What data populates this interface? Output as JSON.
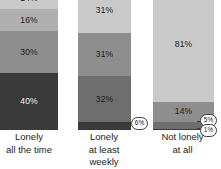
{
  "chart_data": {
    "type": "bar",
    "subtype": "100% stacked column",
    "title": "",
    "subtitle": "",
    "xlabel": "",
    "ylabel": "",
    "ylim": [
      0,
      100
    ],
    "grid": false,
    "legend": "none",
    "note": "Top of the columns is cropped out of frame; topmost segment of each column is partially visible.",
    "categories": [
      "Lonely\nall the time",
      "Lonely\nat least weekly",
      "Not lonely\nat all"
    ],
    "series": [
      {
        "name": "segment-1-lightest",
        "values": [
          14,
          31,
          81
        ]
      },
      {
        "name": "segment-2",
        "values": [
          16,
          31,
          14
        ]
      },
      {
        "name": "segment-3",
        "values": [
          30,
          31,
          5
        ]
      },
      {
        "name": "segment-4",
        "values": [
          40,
          32,
          1
        ]
      },
      {
        "name": "segment-5-darkest",
        "values": [
          null,
          6,
          null
        ]
      }
    ]
  },
  "colors": {
    "background": "#ffffff",
    "shade_lightest": "#c9c9c9",
    "shade_light": "#b0b0b0",
    "shade_mid": "#8e8e8e",
    "shade_dark": "#6e6e6e",
    "shade_darkest": "#3a3a3a",
    "callout_border": "#3a3a3a",
    "label_dark": "#1a1a1a",
    "label_light": "#f2f2f2"
  },
  "columns": [
    {
      "id": "lonely-all-the-time",
      "label_line1": "Lonely",
      "label_line2": "all the time",
      "segments": [
        {
          "value": "14%",
          "pct": 14,
          "shade": "shade_lightest",
          "label_on_dark": false,
          "label_visible": true
        },
        {
          "value": "16%",
          "pct": 16,
          "shade": "shade_light",
          "label_on_dark": false,
          "label_visible": true
        },
        {
          "value": "30%",
          "pct": 30,
          "shade": "shade_mid",
          "label_on_dark": false,
          "label_visible": true
        },
        {
          "value": "40%",
          "pct": 40,
          "shade": "shade_darkest",
          "label_on_dark": true,
          "label_visible": true
        }
      ],
      "callouts": []
    },
    {
      "id": "lonely-at-least-weekly",
      "label_line1": "Lonely",
      "label_line2": "at least weekly",
      "segments": [
        {
          "value": "31%",
          "pct": 31,
          "shade": "shade_lightest",
          "label_on_dark": false,
          "label_visible": true
        },
        {
          "value": "31%",
          "pct": 31,
          "shade": "shade_mid",
          "label_on_dark": false,
          "label_visible": true
        },
        {
          "value": "32%",
          "pct": 32,
          "shade": "shade_dark",
          "label_on_dark": false,
          "label_visible": true
        },
        {
          "value": "6%",
          "pct": 6,
          "shade": "shade_darkest",
          "label_on_dark": true,
          "label_visible": false
        }
      ],
      "callouts": [
        {
          "value": "6%"
        }
      ]
    },
    {
      "id": "not-lonely-at-all",
      "label_line1": "Not lonely",
      "label_line2": "at all",
      "segments": [
        {
          "value": "81%",
          "pct": 81,
          "shade": "shade_lightest",
          "label_on_dark": false,
          "label_visible": true
        },
        {
          "value": "14%",
          "pct": 14,
          "shade": "shade_mid",
          "label_on_dark": false,
          "label_visible": true
        },
        {
          "value": "5%",
          "pct": 5,
          "shade": "shade_dark",
          "label_on_dark": true,
          "label_visible": false
        },
        {
          "value": "1%",
          "pct": 1,
          "shade": "shade_darkest",
          "label_on_dark": true,
          "label_visible": false
        }
      ],
      "callouts": [
        {
          "value": "5%"
        },
        {
          "value": "1%"
        }
      ]
    }
  ]
}
